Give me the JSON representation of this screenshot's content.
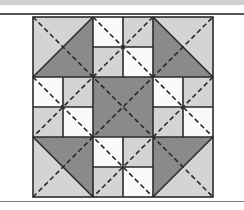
{
  "figure": {
    "type": "quilt-block-diagram",
    "grid": "3x3",
    "colors": {
      "light": "#d4d4d4",
      "dark": "#8a8a8a",
      "white": "#fafafa",
      "line": "#2a2a2a",
      "band": "#cfcfcf"
    },
    "square": {
      "x": 33,
      "y": 17,
      "size": 180
    },
    "blocks": [
      {
        "pos": "top-left",
        "kind": "hst",
        "dark": "lower-right",
        "light": "upper-left"
      },
      {
        "pos": "top-middle",
        "kind": "four-patch",
        "cells": [
          "white",
          "light",
          "light",
          "white"
        ]
      },
      {
        "pos": "top-right",
        "kind": "hst",
        "dark": "lower-left",
        "light": "upper-right"
      },
      {
        "pos": "middle-left",
        "kind": "four-patch",
        "cells": [
          "white",
          "light",
          "light",
          "white"
        ]
      },
      {
        "pos": "center",
        "kind": "solid",
        "color": "dark"
      },
      {
        "pos": "middle-right",
        "kind": "four-patch",
        "cells": [
          "white",
          "light",
          "light",
          "white"
        ]
      },
      {
        "pos": "bottom-left",
        "kind": "hst",
        "dark": "upper-right",
        "light": "lower-left"
      },
      {
        "pos": "bottom-middle",
        "kind": "four-patch",
        "cells": [
          "white",
          "light",
          "light",
          "white"
        ]
      },
      {
        "pos": "bottom-right",
        "kind": "hst",
        "dark": "upper-left",
        "light": "lower-right"
      }
    ],
    "dashed_lines": "main diagonals plus four offset diagonals through side blocks"
  }
}
